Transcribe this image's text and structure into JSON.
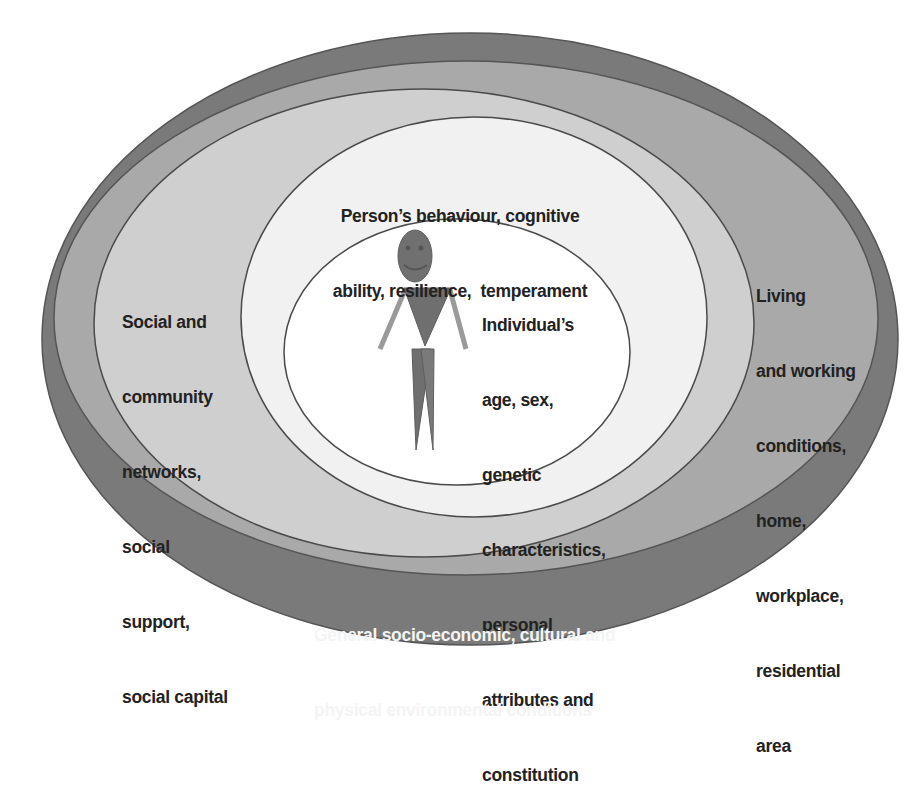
{
  "diagram": {
    "colors": {
      "background": "#ffffff",
      "outer_ring": "#7a7a7a",
      "living_ring": "#a9a9a9",
      "social_ring": "#cfcfcf",
      "behaviour_ring": "#f1f1f1",
      "individual_core": "#ffffff",
      "outline": "#4a4a4a",
      "figure": "#6f6f6f",
      "figure_arms": "#9a9a9a",
      "text_dark": "#222222",
      "text_light": "#f4f4f4"
    },
    "layers": [
      {
        "id": "general-conditions",
        "lines": [
          "General socio-economic, cultural and",
          "physical environmental conditions"
        ]
      },
      {
        "id": "living-working",
        "lines": [
          "Living",
          "and working",
          "conditions,",
          "home,",
          "workplace,",
          "residential",
          "area"
        ]
      },
      {
        "id": "social-community",
        "lines": [
          "Social and",
          "community",
          "networks,",
          "social",
          "support,",
          "social capital"
        ]
      },
      {
        "id": "behaviour",
        "lines": [
          "Person’s behaviour, cognitive",
          "ability, resilience,  temperament"
        ]
      },
      {
        "id": "individual",
        "lines": [
          "Individual’s",
          "age, sex,",
          "genetic",
          "characteristics,",
          "personal",
          "attributes and",
          "constitution"
        ]
      }
    ],
    "figure": {
      "icon": "stick-person-smiley-icon"
    }
  }
}
